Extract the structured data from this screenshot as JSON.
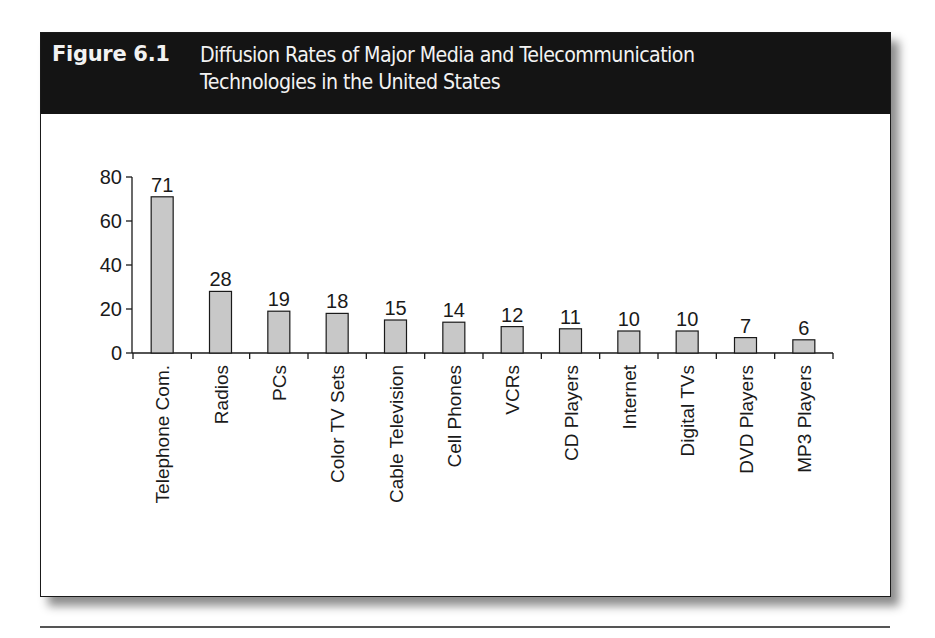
{
  "figure": {
    "number": "Figure 6.1",
    "title_line1": "Diffusion Rates of Major Media and Telecommunication",
    "title_line2": "Technologies in the United States"
  },
  "colors": {
    "header_bg": "#141414",
    "header_text": "#f2f2f2",
    "bar_fill": "#c8c8c8",
    "bar_stroke": "#1a1a1a"
  },
  "chart_data": {
    "type": "bar",
    "title": "Diffusion Rates of Major Media and Telecommunication Technologies in the United States",
    "xlabel": "",
    "ylabel": "",
    "categories": [
      "Telephone Com.",
      "Radios",
      "PCs",
      "Color TV Sets",
      "Cable Television",
      "Cell Phones",
      "VCRs",
      "CD Players",
      "Internet",
      "Digital TVs",
      "DVD Players",
      "MP3 Players"
    ],
    "values": [
      71,
      28,
      19,
      18,
      15,
      14,
      12,
      11,
      10,
      10,
      7,
      6
    ],
    "data_labels": [
      "71",
      "28",
      "19",
      "18",
      "15",
      "14",
      "12",
      "11",
      "10",
      "10",
      "7",
      "6"
    ],
    "yticks": [
      0,
      20,
      40,
      60,
      80
    ],
    "ylim": [
      0,
      80
    ],
    "grid": false,
    "legend": null,
    "x_label_rotation": -90
  }
}
